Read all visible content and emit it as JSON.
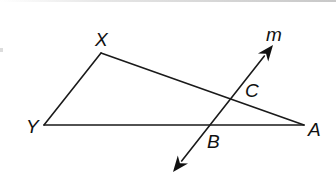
{
  "figure": {
    "width": 336,
    "height": 182,
    "background": "#ffffff",
    "stroke_color": "#1a1a1a"
  },
  "points": {
    "X": {
      "label": "X",
      "x": 101,
      "y": 53,
      "label_x": 95,
      "label_y": 46
    },
    "Y": {
      "label": "Y",
      "x": 44,
      "y": 125,
      "label_x": 26,
      "label_y": 133
    },
    "A": {
      "label": "A",
      "x": 304,
      "y": 125,
      "label_x": 308,
      "label_y": 136
    },
    "B": {
      "label": "B",
      "x": 210,
      "y": 125,
      "label_x": 207,
      "label_y": 148
    },
    "C": {
      "label": "C",
      "x": 231,
      "y": 99,
      "label_x": 245,
      "label_y": 97
    }
  },
  "line_m": {
    "label": "m",
    "label_x": 266,
    "label_y": 41,
    "start": {
      "x": 273,
      "y": 45
    },
    "end": {
      "x": 173,
      "y": 172
    }
  },
  "segments": [
    {
      "name": "segment-XY",
      "from": "X",
      "to": "Y"
    },
    {
      "name": "segment-XA",
      "from": "X",
      "to": "A"
    },
    {
      "name": "segment-YA",
      "from": "Y",
      "to": "A"
    }
  ]
}
